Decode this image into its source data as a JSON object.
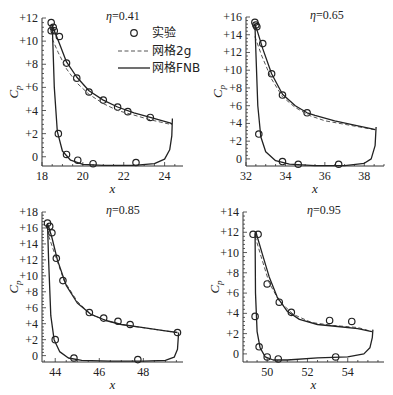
{
  "figure": {
    "legend": {
      "items": [
        {
          "label": "实验",
          "style": "marker-circle"
        },
        {
          "label": "网格2g",
          "style": "dashed-line"
        },
        {
          "label": "网格FNB",
          "style": "solid-line"
        }
      ]
    }
  },
  "chart_data": [
    {
      "type": "line",
      "title": "η=0.41",
      "xlabel": "x",
      "ylabel": "Cp",
      "xlim": [
        18,
        24.9
      ],
      "ylim": [
        -0.8,
        12
      ],
      "xticks": [
        18,
        20,
        22,
        24
      ],
      "xtick_labels": [
        "18",
        "20",
        "22",
        "24"
      ],
      "yticks": [
        0,
        2,
        4,
        6,
        8,
        10,
        12
      ],
      "ytick_labels": [
        "0",
        "+2",
        "+4",
        "+6",
        "+8",
        "+10",
        "+12"
      ],
      "frame": {
        "left": 42,
        "right": 183,
        "top": 18,
        "bottom": 166
      },
      "legend_position": "upper right",
      "series": [
        {
          "name": "实验",
          "kind": "markers",
          "x": [
            18.45,
            18.55,
            18.6,
            18.85,
            19.2,
            19.7,
            20.3,
            21.0,
            21.7,
            22.2,
            23.3,
            18.45,
            18.8,
            19.2,
            19.75,
            20.5,
            22.6
          ],
          "y": [
            11.6,
            11.2,
            10.9,
            10.4,
            8.1,
            6.8,
            5.6,
            4.9,
            4.3,
            3.9,
            3.4,
            10.9,
            2.0,
            0.2,
            -0.3,
            -0.6,
            -0.5
          ]
        },
        {
          "name": "网格2g",
          "kind": "dashed",
          "x": [
            18.5,
            18.8,
            19.2,
            19.7,
            20.3,
            21.0,
            21.7,
            22.5,
            23.3,
            24.3
          ],
          "y": [
            10.2,
            9.0,
            7.6,
            6.4,
            5.4,
            4.6,
            4.0,
            3.6,
            3.2,
            2.8
          ]
        },
        {
          "name": "网格FNB",
          "kind": "solid",
          "x": [
            24.35,
            24.3,
            23.3,
            22.5,
            21.7,
            21.0,
            20.3,
            19.7,
            19.2,
            18.85,
            18.6,
            18.5,
            18.52,
            18.6,
            18.75,
            19.0,
            19.4,
            20.0,
            21.0,
            22.5,
            23.5,
            24.0,
            24.25,
            24.35,
            24.38
          ],
          "y": [
            2.8,
            2.9,
            3.4,
            3.8,
            4.3,
            4.9,
            5.7,
            6.9,
            8.2,
            9.8,
            10.9,
            11.4,
            10.5,
            6.0,
            2.2,
            0.5,
            -0.3,
            -0.65,
            -0.75,
            -0.75,
            -0.6,
            -0.2,
            0.6,
            1.8,
            3.3
          ]
        }
      ]
    },
    {
      "type": "line",
      "title": "η=0.65",
      "xlabel": "x",
      "ylabel": "Cp",
      "xlim": [
        32,
        39
      ],
      "ylim": [
        -0.8,
        16
      ],
      "xticks": [
        32,
        34,
        36,
        38
      ],
      "xtick_labels": [
        "32",
        "34",
        "36",
        "38"
      ],
      "yticks": [
        0,
        2,
        4,
        6,
        8,
        10,
        12,
        14,
        16
      ],
      "ytick_labels": [
        "0",
        "+2",
        "+4",
        "+6",
        "+8",
        "+10",
        "+12",
        "+14",
        "+16"
      ],
      "frame": {
        "left": 246,
        "right": 384,
        "top": 17,
        "bottom": 166
      },
      "series": [
        {
          "name": "实验",
          "kind": "markers",
          "x": [
            32.45,
            32.5,
            32.55,
            32.85,
            33.3,
            33.85,
            35.1,
            32.65,
            33.85,
            34.65,
            36.7
          ],
          "y": [
            15.4,
            15.1,
            14.9,
            13.0,
            9.6,
            7.2,
            5.2,
            2.8,
            -0.3,
            -0.6,
            -0.6
          ]
        },
        {
          "name": "网格2g",
          "kind": "dashed",
          "x": [
            32.45,
            32.8,
            33.3,
            33.85,
            34.5,
            35.2,
            36.0,
            37.0,
            38.5
          ],
          "y": [
            13.8,
            11.6,
            9.0,
            7.0,
            5.8,
            4.9,
            4.3,
            3.9,
            3.3
          ]
        },
        {
          "name": "网格FNB",
          "kind": "solid",
          "x": [
            38.55,
            38.4,
            37.5,
            36.5,
            35.5,
            35.1,
            34.5,
            33.85,
            33.3,
            32.85,
            32.55,
            32.45,
            32.5,
            32.6,
            32.75,
            33.0,
            33.5,
            34.2,
            35.5,
            37.0,
            38.0,
            38.35,
            38.55,
            38.6
          ],
          "y": [
            3.3,
            3.4,
            3.8,
            4.3,
            4.9,
            5.2,
            6.0,
            7.3,
            9.6,
            12.4,
            14.6,
            15.2,
            12.0,
            6.0,
            2.5,
            0.8,
            -0.2,
            -0.6,
            -0.75,
            -0.75,
            -0.5,
            0.0,
            1.5,
            3.6
          ]
        }
      ]
    },
    {
      "type": "line",
      "title": "η=0.85",
      "xlabel": "x",
      "ylabel": "Cp",
      "xlim": [
        43.4,
        49.8
      ],
      "ylim": [
        -0.8,
        18
      ],
      "xticks": [
        44,
        46,
        48
      ],
      "xtick_labels": [
        "44",
        "46",
        "48"
      ],
      "yticks": [
        0,
        2,
        4,
        6,
        8,
        10,
        12,
        14,
        16,
        18
      ],
      "ytick_labels": [
        "0",
        "+2",
        "+4",
        "+6",
        "+8",
        "+10",
        "+12",
        "+14",
        "+16",
        "+18"
      ],
      "frame": {
        "left": 42,
        "right": 183,
        "top": 212,
        "bottom": 362
      },
      "series": [
        {
          "name": "实验",
          "kind": "markers",
          "x": [
            43.65,
            43.75,
            43.85,
            44.05,
            44.35,
            45.55,
            46.2,
            46.85,
            47.4,
            49.55,
            44.0,
            44.85,
            47.75
          ],
          "y": [
            16.6,
            16.2,
            15.4,
            12.2,
            9.4,
            5.4,
            4.7,
            4.3,
            3.9,
            2.9,
            2.0,
            -0.3,
            -0.5
          ]
        },
        {
          "name": "网格2g",
          "kind": "dashed",
          "x": [
            43.7,
            44.0,
            44.4,
            45.0,
            45.6,
            46.3,
            47.0,
            48.0,
            49.5
          ],
          "y": [
            15.0,
            12.6,
            9.4,
            6.8,
            5.2,
            4.4,
            3.9,
            3.5,
            2.9
          ]
        },
        {
          "name": "网格FNB",
          "kind": "solid",
          "x": [
            49.55,
            49.0,
            48.0,
            47.0,
            46.3,
            45.6,
            45.0,
            44.5,
            44.1,
            43.85,
            43.7,
            43.65,
            43.7,
            43.8,
            43.95,
            44.2,
            44.6,
            45.2,
            46.5,
            48.0,
            49.0,
            49.4,
            49.55,
            49.6
          ],
          "y": [
            2.9,
            3.1,
            3.5,
            3.9,
            4.4,
            5.2,
            6.6,
            8.8,
            12.0,
            14.8,
            16.2,
            16.5,
            12.0,
            5.0,
            2.0,
            0.5,
            -0.3,
            -0.6,
            -0.7,
            -0.7,
            -0.6,
            -0.2,
            0.8,
            2.9
          ]
        }
      ]
    },
    {
      "type": "line",
      "title": "η=0.95",
      "xlabel": "x",
      "ylabel": "Cp",
      "xlim": [
        48.8,
        55.8
      ],
      "ylim": [
        -0.8,
        14
      ],
      "xticks": [
        50,
        52,
        54
      ],
      "xtick_labels": [
        "50",
        "52",
        "54"
      ],
      "yticks": [
        0,
        2,
        4,
        6,
        8,
        10,
        12,
        14
      ],
      "ytick_labels": [
        "0",
        "+2",
        "+4",
        "+6",
        "+8",
        "+10",
        "+12",
        "+14"
      ],
      "frame": {
        "left": 243,
        "right": 384,
        "top": 212,
        "bottom": 362
      },
      "series": [
        {
          "name": "实验",
          "kind": "markers",
          "x": [
            49.3,
            49.55,
            50.0,
            50.6,
            51.2,
            53.1,
            54.2,
            49.4,
            49.6,
            50.0,
            50.55,
            53.4
          ],
          "y": [
            11.8,
            11.8,
            6.9,
            5.1,
            4.1,
            3.3,
            3.2,
            3.7,
            0.7,
            -0.3,
            -0.5,
            -0.3
          ]
        },
        {
          "name": "网格2g",
          "kind": "dashed",
          "x": [
            49.4,
            49.7,
            50.1,
            50.6,
            51.3,
            52.2,
            53.3,
            54.5,
            55.2
          ],
          "y": [
            11.6,
            9.6,
            7.0,
            5.2,
            3.9,
            3.1,
            2.8,
            2.6,
            2.2
          ]
        },
        {
          "name": "网格FNB",
          "kind": "solid",
          "x": [
            55.2,
            54.5,
            53.5,
            52.5,
            51.6,
            51.0,
            50.5,
            50.1,
            49.8,
            49.5,
            49.45,
            49.4,
            49.42,
            49.5,
            49.65,
            49.9,
            50.3,
            51.0,
            52.5,
            54.0,
            54.8,
            55.1,
            55.22,
            55.25
          ],
          "y": [
            2.2,
            2.5,
            2.7,
            2.9,
            3.4,
            4.2,
            5.6,
            7.6,
            9.6,
            11.6,
            12.0,
            11.6,
            6.0,
            2.2,
            0.6,
            -0.3,
            -0.6,
            -0.6,
            -0.4,
            -0.3,
            0.0,
            0.6,
            1.6,
            2.4
          ]
        }
      ]
    }
  ]
}
